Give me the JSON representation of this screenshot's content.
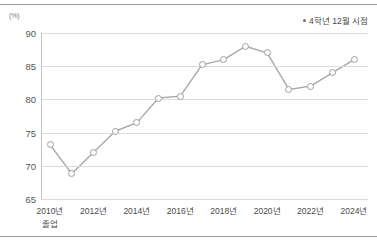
{
  "chart_data": {
    "type": "line",
    "title": "",
    "xlabel": "",
    "ylabel": "",
    "unit_label": "(%)",
    "ylim": [
      65,
      90
    ],
    "yticks": [
      90,
      85,
      80,
      75,
      70,
      65
    ],
    "grid": true,
    "legend_position": "top-right",
    "legend": [
      "4학년 12월 시점"
    ],
    "x": [
      "2010년",
      "2011년",
      "2012년",
      "2013년",
      "2014년",
      "2015년",
      "2016년",
      "2017년",
      "2018년",
      "2019년",
      "2020년",
      "2021년",
      "2022년",
      "2023년",
      "2024년"
    ],
    "xtick_labels": [
      "2010년",
      "2012년",
      "2014년",
      "2016년",
      "2018년",
      "2020년",
      "2022년",
      "2024년"
    ],
    "xtick_sublabel_first": "졸업",
    "series": [
      {
        "name": "4학년 12월 시점",
        "values": [
          73.2,
          68.8,
          72.0,
          75.2,
          76.5,
          80.2,
          80.5,
          85.2,
          86.0,
          88.0,
          87.0,
          81.5,
          82.0,
          84.0,
          86.0
        ]
      }
    ],
    "colors": {
      "line": "#a8a8a8",
      "marker_fill": "#ffffff",
      "marker_stroke": "#9e9e9e",
      "grid": "#dcdcdc",
      "text": "#4a4a4a",
      "rule": "#9a9a9a"
    }
  }
}
